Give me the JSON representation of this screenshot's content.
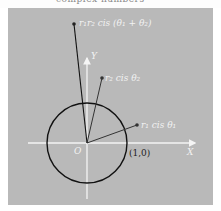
{
  "header": {
    "caption_partial": "complex numbers"
  },
  "diagram": {
    "background_color": "#b9b9b9",
    "axis_color": "#f5f5f5",
    "circle_color": "#111111",
    "vector_color": "#333333",
    "axes": {
      "x_label": "X",
      "y_label": "Y",
      "origin_label": "O"
    },
    "unit_point_label": "(1,0)",
    "points": [
      {
        "id": "z1",
        "label": "r₁ cis θ₁"
      },
      {
        "id": "z2",
        "label": "r₂ cis θ₂"
      },
      {
        "id": "product",
        "label": "r₁r₂ cis (θ₁ + θ₂)"
      }
    ]
  }
}
